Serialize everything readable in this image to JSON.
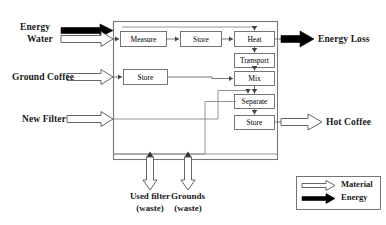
{
  "diagram": {
    "system_boundary": {
      "label": "system boundary"
    },
    "inputs": [
      {
        "id": "energy-in",
        "label": "Energy",
        "flow_type": "energy"
      },
      {
        "id": "water-in",
        "label": "Water",
        "flow_type": "material"
      },
      {
        "id": "ground-coffee-in",
        "label": "Ground Coffee",
        "flow_type": "material"
      },
      {
        "id": "new-filter-in",
        "label": "New Filter",
        "flow_type": "material"
      }
    ],
    "outputs": [
      {
        "id": "energy-loss-out",
        "label": "Energy Loss",
        "flow_type": "energy"
      },
      {
        "id": "hot-coffee-out",
        "label": "Hot Coffee",
        "flow_type": "material"
      }
    ],
    "waste_outputs": [
      {
        "id": "used-filter-waste",
        "line1": "Used filter",
        "line2": "(waste)",
        "flow_type": "material"
      },
      {
        "id": "grounds-waste",
        "line1": "Grounds",
        "line2": "(waste)",
        "flow_type": "material"
      }
    ],
    "process_blocks": [
      {
        "id": "measure",
        "label": "Measure"
      },
      {
        "id": "store-water",
        "label": "Store"
      },
      {
        "id": "heat",
        "label": "Heat"
      },
      {
        "id": "transport",
        "label": "Transport"
      },
      {
        "id": "store-coffee",
        "label": "Store"
      },
      {
        "id": "mix",
        "label": "Mix"
      },
      {
        "id": "separate",
        "label": "Separate"
      },
      {
        "id": "store-brew",
        "label": "Store"
      }
    ],
    "legend": {
      "entries": [
        {
          "id": "legend-material",
          "label": "Material",
          "flow_type": "material"
        },
        {
          "id": "legend-energy",
          "label": "Energy",
          "flow_type": "energy"
        }
      ]
    },
    "colors": {
      "material_arrow_fill": "#ffffff",
      "material_arrow_stroke": "#555555",
      "energy_arrow_fill": "#000000",
      "line": "#666666",
      "box_stroke": "#666666",
      "text": "#1a1a1a",
      "background": "#ffffff"
    }
  }
}
